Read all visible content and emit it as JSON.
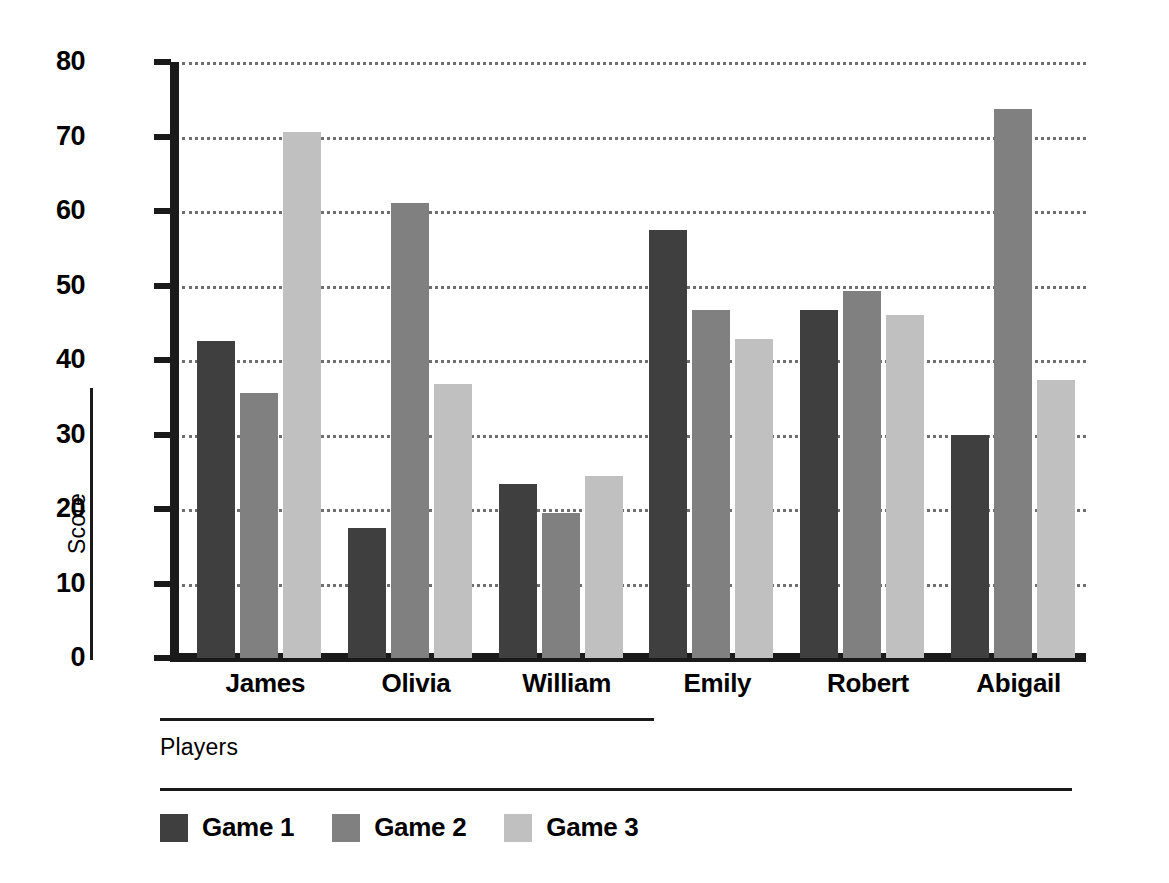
{
  "chart_data": {
    "type": "bar",
    "title": "",
    "xlabel": "Players",
    "ylabel": "Score",
    "categories": [
      "James",
      "Olivia",
      "William",
      "Emily",
      "Robert",
      "Abigail"
    ],
    "series": [
      {
        "name": "Game 1",
        "color": "#3f3f3f",
        "values": [
          42.5,
          17.5,
          23.3,
          57.5,
          46.7,
          30.0
        ]
      },
      {
        "name": "Game 2",
        "color": "#808080",
        "values": [
          35.6,
          61.1,
          19.4,
          46.7,
          49.2,
          73.7
        ]
      },
      {
        "name": "Game 3",
        "color": "#c0c0c0",
        "values": [
          70.6,
          36.8,
          24.4,
          42.8,
          46.1,
          37.3
        ]
      }
    ],
    "ylim": [
      0,
      80
    ],
    "yticks": [
      0,
      10,
      20,
      30,
      40,
      50,
      60,
      70,
      80
    ],
    "ytick_labels": [
      "0",
      "10",
      "20",
      "30",
      "40",
      "50",
      "60",
      "70",
      "80"
    ],
    "grid": true,
    "grid_style": "dotted",
    "grid_axis": "y",
    "legend_position": "bottom-left",
    "legend_entries": [
      "Game 1",
      "Game 2",
      "Game 3"
    ],
    "axis_color": "#1a1a1a",
    "background": "#ffffff"
  }
}
